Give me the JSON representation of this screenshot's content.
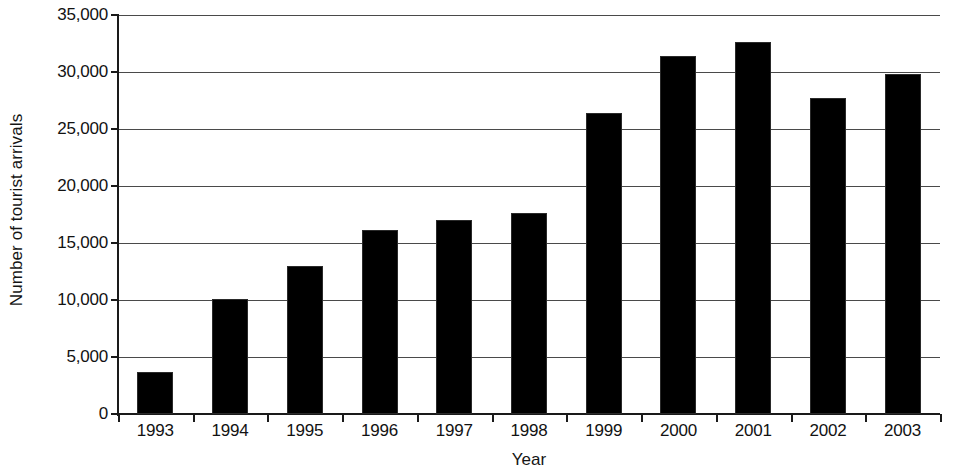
{
  "chart_data": {
    "type": "bar",
    "title": "",
    "subtitle": "",
    "xlabel": "Year",
    "ylabel": "Number of tourist arrivals",
    "categories": [
      "1993",
      "1994",
      "1995",
      "1996",
      "1997",
      "1998",
      "1999",
      "2000",
      "2001",
      "2002",
      "2003"
    ],
    "values": [
      3700,
      10100,
      13000,
      16100,
      17000,
      17600,
      26400,
      31400,
      32600,
      27700,
      29800
    ],
    "series": [
      {
        "name": "Number of tourist arrivals",
        "values": [
          3700,
          10100,
          13000,
          16100,
          17000,
          17600,
          26400,
          31400,
          32600,
          27700,
          29800
        ]
      }
    ],
    "ylim": [
      0,
      35000
    ],
    "ytick_values": [
      0,
      5000,
      10000,
      15000,
      20000,
      25000,
      30000,
      35000
    ],
    "ytick_labels": [
      "0",
      "5,000",
      "10,000",
      "15,000",
      "20,000",
      "25,000",
      "30,000",
      "35,000"
    ],
    "grid": true,
    "grid_axis": "y",
    "legend": false,
    "legend_position": "none",
    "bar_color": "#000000",
    "background_color": "#ffffff",
    "axis_color": "#1a1a1a",
    "annotations": []
  }
}
